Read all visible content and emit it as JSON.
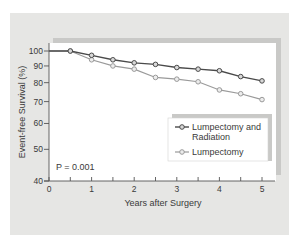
{
  "chart_data": {
    "type": "line",
    "title": "",
    "xlabel": "Years after Surgery",
    "ylabel": "Event-free Survival (%)",
    "x_ticks": [
      "0",
      "1",
      "2",
      "3",
      "4",
      "5"
    ],
    "y_ticks": [
      "40",
      "50",
      "60",
      "70",
      "80",
      "90",
      "100"
    ],
    "xlim": [
      0,
      5
    ],
    "ylim": [
      40,
      100
    ],
    "y_scale": "log",
    "grid": false,
    "legend_position": "lower right (inside plot)",
    "annotation": "P = 0.001",
    "x": [
      0,
      0.5,
      1,
      1.5,
      2,
      2.5,
      3,
      3.5,
      4,
      4.5,
      5
    ],
    "series": [
      {
        "name": "Lumpectomy and Radiation",
        "color": "#4a4a4a",
        "values": [
          100,
          100,
          97,
          94,
          92,
          91,
          89,
          88,
          87,
          83.5,
          81
        ]
      },
      {
        "name": "Lumpectomy",
        "color": "#9a9a9a",
        "values": [
          100,
          100,
          94,
          90,
          88,
          83,
          82,
          80.5,
          76,
          74,
          71
        ]
      }
    ]
  },
  "labels": {
    "ylabel": "Event-free Survival (%)",
    "xlabel": "Years after Surgery",
    "annotation": "P = 0.001",
    "legend_line1_a": "Lumpectomy and",
    "legend_line1_b": "Radiation",
    "legend_line2": "Lumpectomy"
  }
}
